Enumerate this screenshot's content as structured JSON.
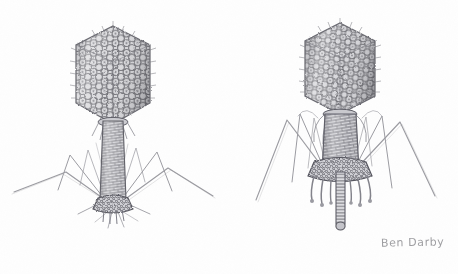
{
  "artwork": {
    "title": "Bacteriophage Pair",
    "medium": "graphite pencil drawing",
    "subject": "two T4-like bacteriophage viruses",
    "background_color": "#fefefe",
    "ink_color": "#8a8a8e",
    "dark_ink_color": "#5f5f64",
    "light_ink_color": "#b6b6bb"
  },
  "signature": {
    "text": "Ben Darby",
    "color": "#8e8e92",
    "position": "bottom-right"
  },
  "specimens": [
    {
      "id": "phage-left",
      "label": "Bacteriophage with extended tail sheath",
      "center_x": 113,
      "head": {
        "label": "icosahedral capsid head",
        "center_x": 113,
        "center_y": 75,
        "width": 74,
        "height": 96,
        "texture": "capsomere hexagonal lattice"
      },
      "collar": {
        "label": "neck and collar",
        "center_y": 118
      },
      "sheath": {
        "label": "extended helical tail sheath",
        "top_y": 120,
        "bottom_y": 205,
        "width": 22,
        "texture": "helical brick striations"
      },
      "baseplate": {
        "label": "baseplate",
        "center_y": 207,
        "width": 40
      },
      "fiber_count": 6,
      "fiber_label": "long jointed tail fibers"
    },
    {
      "id": "phage-right",
      "label": "Bacteriophage with contracted sheath and extended tail tube",
      "center_x": 340,
      "head": {
        "label": "icosahedral capsid head",
        "center_x": 340,
        "center_y": 68,
        "width": 70,
        "height": 88,
        "texture": "capsomere hexagonal lattice"
      },
      "collar": {
        "label": "neck and collar",
        "center_y": 112
      },
      "sheath": {
        "label": "contracted tail sheath",
        "top_y": 114,
        "bottom_y": 175,
        "width": 34,
        "texture": "compressed ring striations"
      },
      "tail_tube": {
        "label": "extended tail tube",
        "top_y": 175,
        "bottom_y": 228,
        "width": 9
      },
      "baseplate": {
        "label": "baseplate",
        "center_y": 176,
        "width": 58
      },
      "fiber_count": 6,
      "fiber_label": "long jointed tail fibers",
      "whisker_count": 7,
      "whisker_label": "short baseplate whiskers"
    }
  ]
}
